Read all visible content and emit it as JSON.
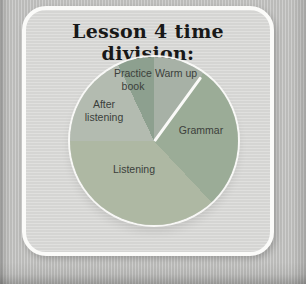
{
  "page": {
    "title": "Lesson 4 time division:"
  },
  "theme": {
    "page_bg": "#c2c2c0",
    "card_bg": "#d9d9d7",
    "card_border": "#fbfbf9",
    "title_color": "#181818",
    "label_color": "#3b3f3b",
    "divider_color": "#fafaf8"
  },
  "chart_data": {
    "type": "pie",
    "title": "Lesson 4 time division:",
    "start_angle_deg": 0,
    "direction": "clockwise",
    "legend": "none",
    "labels_on_chart": true,
    "divider_line_between": [
      "Warm up",
      "Grammar"
    ],
    "slices": [
      {
        "label": "Warm up",
        "percent": 10,
        "color": "#a7b1a6"
      },
      {
        "label": "Grammar",
        "percent": 28,
        "color": "#9bac97"
      },
      {
        "label": "Listening",
        "percent": 37,
        "color": "#aeb8a3"
      },
      {
        "label": "After listening",
        "percent": 18,
        "color": "#b3bbb0"
      },
      {
        "label": "Practice book",
        "percent": 7,
        "color": "#8da08f"
      }
    ]
  }
}
